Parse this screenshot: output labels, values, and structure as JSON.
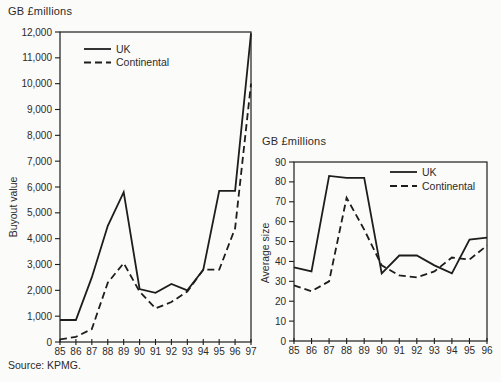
{
  "page": {
    "source_note": "Source: KPMG.",
    "ink_color": "#1d1d1d",
    "text_color": "#2b2b2b",
    "background_color": "#fbfbf9"
  },
  "chart_data": [
    {
      "type": "line",
      "title": "GB £millions",
      "ylabel": "Buyout value",
      "xlabel": "",
      "categories": [
        "85",
        "86",
        "87",
        "88",
        "89",
        "90",
        "91",
        "92",
        "93",
        "94",
        "95",
        "96",
        "97"
      ],
      "ylim": [
        0,
        12000
      ],
      "ytick_step": 1000,
      "grid": false,
      "legend_position": "top-left",
      "series": [
        {
          "name": "UK",
          "style": "solid",
          "values": [
            850,
            850,
            2500,
            4500,
            5800,
            2050,
            1900,
            2250,
            2000,
            2800,
            5850,
            5850,
            11950
          ]
        },
        {
          "name": "Continental",
          "style": "dashed",
          "values": [
            100,
            200,
            500,
            2300,
            3050,
            1950,
            1300,
            1550,
            1950,
            2800,
            2800,
            4400,
            10000
          ]
        }
      ]
    },
    {
      "type": "line",
      "title": "GB £millions",
      "ylabel": "Average size",
      "xlabel": "",
      "categories": [
        "85",
        "86",
        "87",
        "88",
        "89",
        "90",
        "91",
        "92",
        "93",
        "94",
        "95",
        "96"
      ],
      "ylim": [
        0,
        90
      ],
      "ytick_step": 10,
      "grid": false,
      "legend_position": "top-right",
      "series": [
        {
          "name": "UK",
          "style": "solid",
          "values": [
            37,
            35,
            83,
            82,
            82,
            34,
            43,
            43,
            38,
            34,
            51,
            52
          ]
        },
        {
          "name": "Continental",
          "style": "dashed",
          "values": [
            28,
            25,
            30,
            72,
            56,
            38,
            33,
            32,
            35,
            42,
            41,
            48
          ]
        }
      ]
    }
  ]
}
